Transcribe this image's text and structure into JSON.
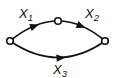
{
  "figure": {
    "type": "directed-graph",
    "background_color": "#ffffff",
    "stroke_color": "#111111",
    "nodes": [
      {
        "id": "left-node",
        "shape": "open-circle"
      },
      {
        "id": "middle-node",
        "shape": "open-circle"
      },
      {
        "id": "right-node",
        "shape": "open-circle"
      }
    ],
    "edges": [
      {
        "from": "left-node",
        "to": "middle-node",
        "label": {
          "base": "X",
          "sub": "1"
        }
      },
      {
        "from": "middle-node",
        "to": "right-node",
        "label": {
          "base": "X",
          "sub": "2"
        }
      },
      {
        "from": "left-node",
        "to": "right-node",
        "label": {
          "base": "X",
          "sub": "3"
        }
      }
    ]
  }
}
